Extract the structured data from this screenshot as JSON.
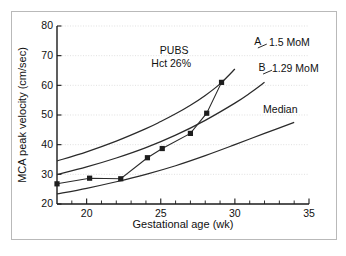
{
  "figure": {
    "background": "#ffffff",
    "border_color": "#b9b9b9",
    "ink_color": "#1a1a1a",
    "grid_color": "#d2d2d2"
  },
  "chart_data": {
    "type": "line",
    "title": "",
    "xlabel": "Gestational age (wk)",
    "ylabel": "MCA peak velocity (cm/sec)",
    "xlim": [
      18,
      35
    ],
    "ylim": [
      20,
      80
    ],
    "xticks": [
      20,
      25,
      30,
      35
    ],
    "xtick_labels": [
      "20",
      "25",
      "30",
      "35"
    ],
    "xminor_ticks": [
      19,
      21,
      22,
      23,
      24,
      26,
      27,
      28,
      29,
      31,
      32,
      33,
      34
    ],
    "yticks": [
      20,
      30,
      40,
      50,
      60,
      70,
      80
    ],
    "ytick_labels": [
      "20",
      "30",
      "40",
      "50",
      "60",
      "70",
      "80"
    ],
    "grid": "horizontal-dotted",
    "legend_position": "right-inline",
    "series": [
      {
        "name": "1.5 MoM",
        "curve_label": "A",
        "label": "1.5 MoM",
        "x": [
          18,
          20,
          22,
          24,
          25,
          26,
          27,
          28,
          29,
          30
        ],
        "y": [
          34.5,
          37.6,
          41.2,
          45.4,
          47.8,
          50.4,
          53.3,
          56.6,
          60.5,
          65.5
        ]
      },
      {
        "name": "1.29 MoM",
        "curve_label": "B",
        "label": "1.29 MoM",
        "x": [
          18,
          20,
          22,
          24,
          26,
          28,
          30,
          31,
          32
        ],
        "y": [
          29.9,
          32.5,
          35.5,
          39.0,
          43.2,
          48.2,
          54.0,
          57.3,
          61.0
        ]
      },
      {
        "name": "Median",
        "curve_label": "",
        "label": "Median",
        "x": [
          18,
          20,
          22,
          24,
          26,
          28,
          30,
          32,
          34
        ],
        "y": [
          23.4,
          25.3,
          27.5,
          30.0,
          32.9,
          36.3,
          40.0,
          43.8,
          47.5
        ]
      },
      {
        "name": "PUBS measurements",
        "curve_label": "",
        "label": "PUBS",
        "marker": "square",
        "x": [
          18.0,
          20.2,
          22.3,
          24.1,
          25.1,
          27.0,
          28.1,
          29.1
        ],
        "y": [
          26.8,
          28.7,
          28.5,
          35.6,
          38.7,
          43.8,
          50.6,
          61.0
        ]
      }
    ],
    "annotations": [
      {
        "name": "pubs-label",
        "text": "PUBS",
        "x": 25.9,
        "y": 70.5
      },
      {
        "name": "hct-label",
        "text": "Hct 26%",
        "x": 25.7,
        "y": 66.3
      },
      {
        "name": "curve-a-letter",
        "text": "A",
        "x": 31.3,
        "y": 73.5
      },
      {
        "name": "curve-a-name",
        "text": "1.5 MoM",
        "x": 32.3,
        "y": 73.2
      },
      {
        "name": "curve-b-letter",
        "text": "B",
        "x": 31.6,
        "y": 64.7
      },
      {
        "name": "curve-b-name",
        "text": "1.29 MoM",
        "x": 32.5,
        "y": 64.4
      },
      {
        "name": "median-name",
        "text": "Median",
        "x": 31.9,
        "y": 50.8
      }
    ]
  },
  "labels": {
    "y_axis_title": "MCA peak velocity (cm/sec)",
    "x_axis_title": "Gestational age (wk)",
    "pubs": "PUBS",
    "hct": "Hct 26%",
    "a_letter": "A",
    "a_name": "1.5 MoM",
    "b_letter": "B",
    "b_name": "1.29 MoM",
    "median_name": "Median"
  }
}
